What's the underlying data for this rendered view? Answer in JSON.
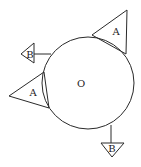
{
  "diagram": {
    "type": "circle-with-attached-triangles",
    "center": {
      "label": "O",
      "cx": 88,
      "cy": 83,
      "r": 46
    },
    "triangles": [
      {
        "id": "A-top-right",
        "label": "A",
        "points": "92,35 127,10 126,54",
        "label_x": 116,
        "label_y": 31
      },
      {
        "id": "A-left",
        "label": "A",
        "points": "44,72 9,96 49,108",
        "label_x": 33,
        "label_y": 92
      },
      {
        "id": "B-left",
        "label": "B",
        "points": "21,54 34,43 34,63",
        "label_x": 30,
        "label_y": 54,
        "connector": {
          "x1": 34,
          "y1": 54,
          "x2": 51,
          "y2": 54
        }
      },
      {
        "id": "B-bottom",
        "label": "B",
        "points": "101,143 124,143 112,157",
        "label_x": 112,
        "label_y": 148,
        "connector": {
          "x1": 111,
          "y1": 125,
          "x2": 111,
          "y2": 143
        }
      }
    ],
    "colors": {
      "stroke": "#2a2a2a",
      "background": "#ffffff"
    }
  }
}
